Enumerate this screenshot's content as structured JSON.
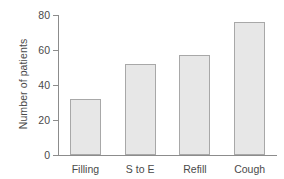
{
  "chart_data": {
    "type": "bar",
    "title": "",
    "xlabel": "",
    "ylabel": "Number of patients",
    "categories": [
      "Filling",
      "S to E",
      "Refill",
      "Cough"
    ],
    "values": [
      32,
      52,
      57,
      76
    ],
    "ylim": [
      0,
      80
    ],
    "yticks": [
      0,
      20,
      40,
      60,
      80
    ],
    "ytick_labels": [
      "0",
      "20",
      "40",
      "60",
      "80"
    ],
    "grid": false,
    "legend": null,
    "series": [
      {
        "name": "Number of patients",
        "values": [
          32,
          52,
          57,
          76
        ]
      }
    ],
    "colors": {
      "bar_fill": "#e7e7e7",
      "bar_edge": "#a8a8a8",
      "axis": "#8c8c8c",
      "text": "#4a4a4a",
      "background": "#ffffff"
    }
  }
}
